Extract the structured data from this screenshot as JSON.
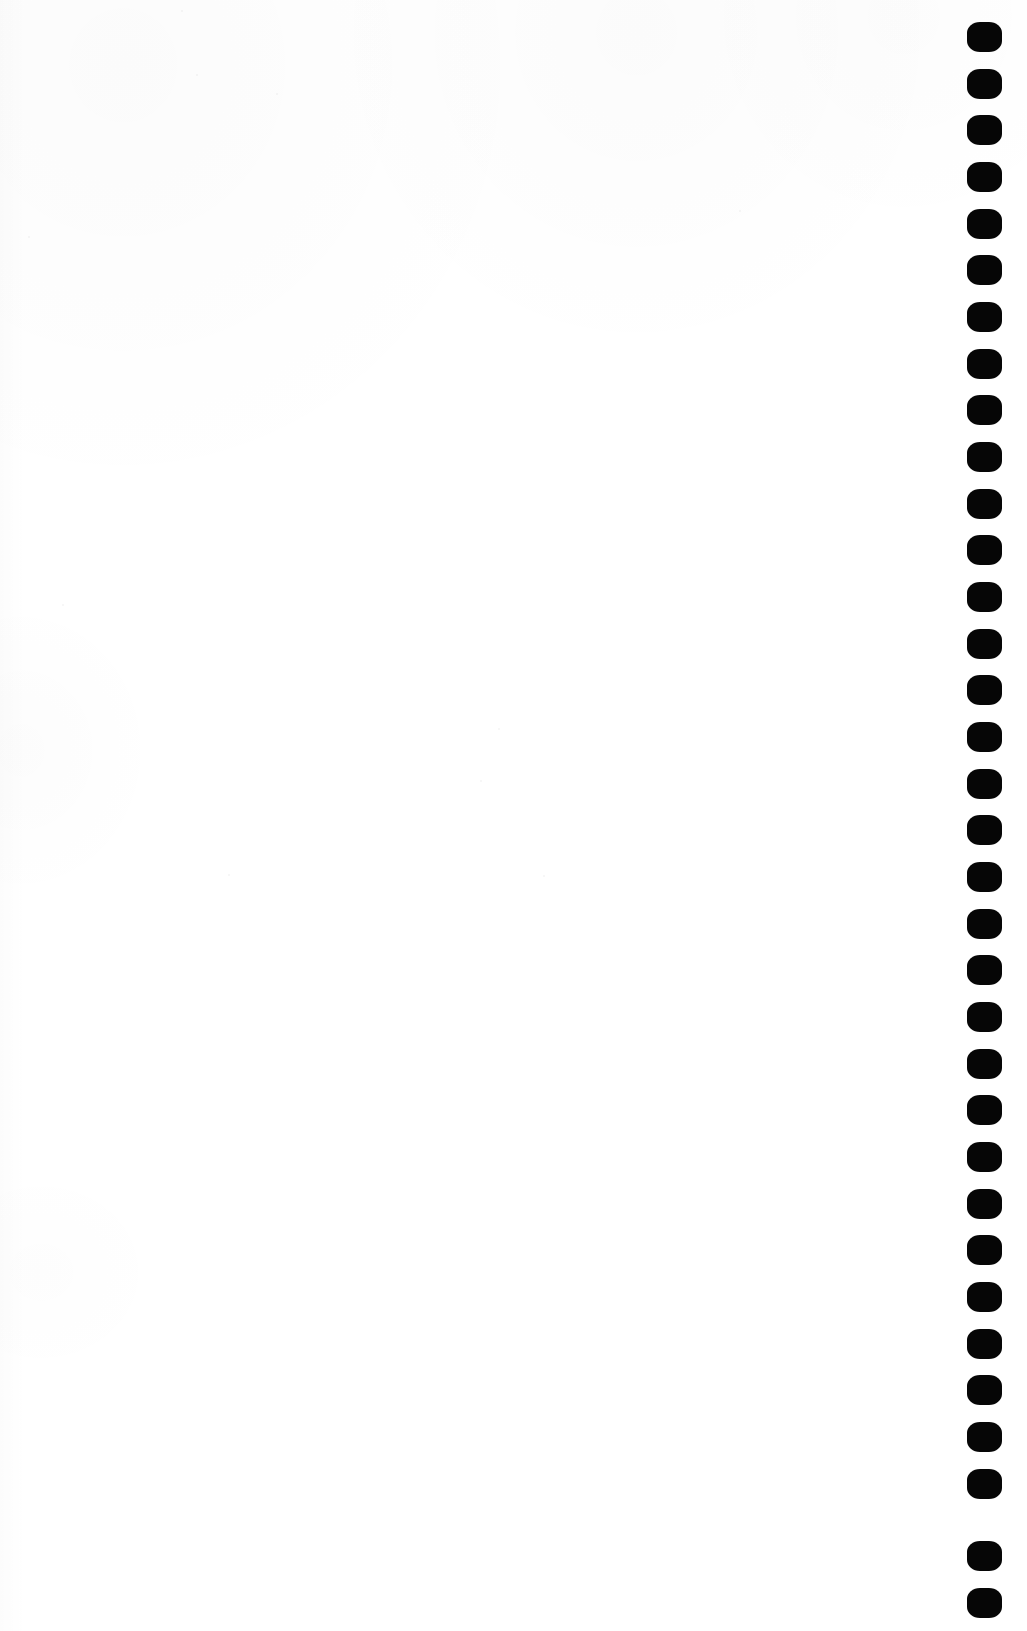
{
  "document": {
    "type": "scanned-page",
    "page_label": "",
    "content_text": "",
    "description": "Blank scanned book page with comb/spiral binding punch holes along the right margin",
    "page_width": 1027,
    "page_height": 1631,
    "paper_color": "#ffffff",
    "ink_color": "#060606"
  },
  "binding": {
    "name": "binding-hole-column",
    "edge": "right",
    "hole_count": 34,
    "hole_shape": "rounded-rect",
    "hole_width": 35,
    "hole_height": 30,
    "hole_left": 967,
    "first_hole_center_y": 37,
    "hole_pitch": 46.7,
    "hole_color": "#060606",
    "holes": [
      {
        "index": 1,
        "center_y": 37
      },
      {
        "index": 2,
        "center_y": 84
      },
      {
        "index": 3,
        "center_y": 130
      },
      {
        "index": 4,
        "center_y": 177
      },
      {
        "index": 5,
        "center_y": 224
      },
      {
        "index": 6,
        "center_y": 270
      },
      {
        "index": 7,
        "center_y": 317
      },
      {
        "index": 8,
        "center_y": 364
      },
      {
        "index": 9,
        "center_y": 410
      },
      {
        "index": 10,
        "center_y": 457
      },
      {
        "index": 11,
        "center_y": 504
      },
      {
        "index": 12,
        "center_y": 550
      },
      {
        "index": 13,
        "center_y": 597
      },
      {
        "index": 14,
        "center_y": 644
      },
      {
        "index": 15,
        "center_y": 690
      },
      {
        "index": 16,
        "center_y": 737
      },
      {
        "index": 17,
        "center_y": 784
      },
      {
        "index": 18,
        "center_y": 830
      },
      {
        "index": 19,
        "center_y": 877
      },
      {
        "index": 20,
        "center_y": 924
      },
      {
        "index": 21,
        "center_y": 970
      },
      {
        "index": 22,
        "center_y": 1017
      },
      {
        "index": 23,
        "center_y": 1064
      },
      {
        "index": 24,
        "center_y": 1110
      },
      {
        "index": 25,
        "center_y": 1157
      },
      {
        "index": 26,
        "center_y": 1204
      },
      {
        "index": 27,
        "center_y": 1250
      },
      {
        "index": 28,
        "center_y": 1297
      },
      {
        "index": 29,
        "center_y": 1344
      },
      {
        "index": 30,
        "center_y": 1390
      },
      {
        "index": 31,
        "center_y": 1437
      },
      {
        "index": 32,
        "center_y": 1484
      },
      {
        "index": 33,
        "center_y": 1556
      },
      {
        "index": 34,
        "center_y": 1603
      }
    ]
  },
  "specks": [
    {
      "x": 181,
      "y": 10,
      "size": 2
    },
    {
      "x": 196,
      "y": 74,
      "size": 2
    },
    {
      "x": 276,
      "y": 93,
      "size": 2
    },
    {
      "x": 498,
      "y": 728,
      "size": 2
    },
    {
      "x": 543,
      "y": 875,
      "size": 2
    },
    {
      "x": 28,
      "y": 236,
      "size": 2
    },
    {
      "x": 62,
      "y": 604,
      "size": 2
    },
    {
      "x": 228,
      "y": 874,
      "size": 2
    },
    {
      "x": 480,
      "y": 780,
      "size": 2
    },
    {
      "x": 739,
      "y": 210,
      "size": 2
    }
  ]
}
